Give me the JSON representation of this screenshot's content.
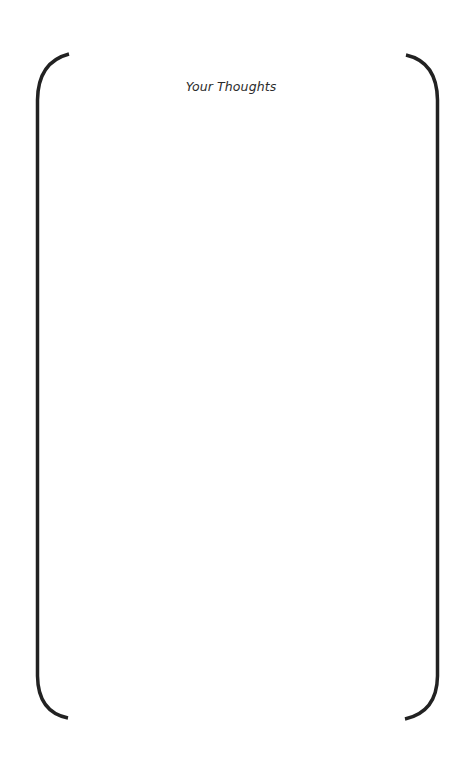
{
  "page": {
    "title": "Your Thoughts",
    "writing_area": {
      "content": ""
    }
  },
  "colors": {
    "background": "#ffffff",
    "bracket_stroke": "#222222",
    "title_text": "#2b2b2b"
  }
}
